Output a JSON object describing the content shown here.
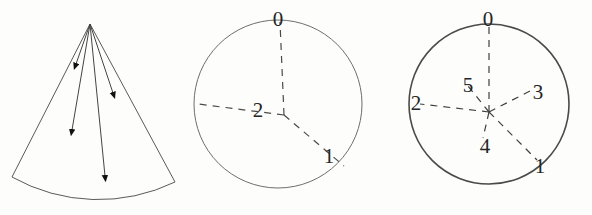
{
  "figure": {
    "caption": "",
    "panel_count": 3,
    "background_color": "#fdfdfc",
    "ink_color": "#3a3a3a"
  },
  "panels": [
    {
      "id": "cone",
      "name": "cone-of-directions",
      "shape": "circular-sector",
      "stroke_color": "#5a5a5a",
      "stroke_width": 1.0,
      "apex": {
        "x": 90,
        "y": 24
      },
      "arc_left": {
        "x": 12,
        "y": 177
      },
      "arc_right": {
        "x": 175,
        "y": 182
      },
      "arrow_count": 4,
      "arrows": [
        {
          "id": "arrow-1",
          "label": "",
          "tip_x": 76,
          "tip_y": 66,
          "length": "short"
        },
        {
          "id": "arrow-2",
          "label": "",
          "tip_x": 114,
          "tip_y": 96,
          "length": "medium"
        },
        {
          "id": "arrow-3",
          "label": "",
          "tip_x": 72,
          "tip_y": 134,
          "length": "long"
        },
        {
          "id": "arrow-4",
          "label": "",
          "tip_x": 106,
          "tip_y": 182,
          "length": "longest"
        }
      ]
    },
    {
      "id": "circle-3",
      "name": "circle-with-three-radii",
      "shape": "circle",
      "stroke_color": "#6e6e6e",
      "stroke_width": 1.0,
      "center": {
        "x": 86,
        "y": 104
      },
      "radius": 84,
      "junction": {
        "x": 92,
        "y": 115
      },
      "radius_count": 3,
      "radii": [
        {
          "label": "0",
          "angle_deg": 90,
          "label_x": 86,
          "label_y": 19,
          "endpoint_x": 88,
          "endpoint_y": 22
        },
        {
          "label": "1",
          "angle_deg": -42,
          "label_x": 137,
          "label_y": 156,
          "endpoint_x": 152,
          "endpoint_y": 166
        },
        {
          "label": "2",
          "angle_deg": 186,
          "label_x": 66,
          "label_y": 110,
          "endpoint_x": 6,
          "endpoint_y": 104
        }
      ]
    },
    {
      "id": "circle-6",
      "name": "circle-with-six-radii",
      "shape": "circle",
      "stroke_color": "#4a4a4a",
      "stroke_width": 1.6,
      "center": {
        "x": 99,
        "y": 104
      },
      "radius": 80,
      "junction": {
        "x": 99,
        "y": 112
      },
      "radius_count": 6,
      "radii": [
        {
          "label": "0",
          "angle_deg": 90,
          "label_x": 98,
          "label_y": 19,
          "endpoint_x": 99,
          "endpoint_y": 25
        },
        {
          "label": "1",
          "angle_deg": -48,
          "label_x": 148,
          "label_y": 166,
          "endpoint_x": 146,
          "endpoint_y": 160
        },
        {
          "label": "2",
          "angle_deg": 191,
          "label_x": 28,
          "label_y": 103,
          "endpoint_x": 30,
          "endpoint_y": 105
        },
        {
          "label": "3",
          "angle_deg": 36,
          "label_x": 146,
          "label_y": 95,
          "endpoint_x": 140,
          "endpoint_y": 93
        },
        {
          "label": "4",
          "angle_deg": 256,
          "label_x": 95,
          "label_y": 147,
          "endpoint_x": 94,
          "endpoint_y": 142
        },
        {
          "label": "5",
          "angle_deg": 118,
          "label_x": 79,
          "label_y": 87,
          "endpoint_x": 80,
          "endpoint_y": 89
        }
      ]
    }
  ]
}
